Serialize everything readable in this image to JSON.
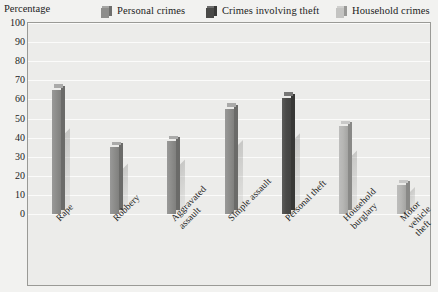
{
  "axis_title": "Percentage",
  "legend": {
    "items": [
      {
        "label": "Personal crimes",
        "icon": "cube-icon",
        "color": "#8e8e8c"
      },
      {
        "label": "Crimes involving theft",
        "icon": "cube-icon",
        "color": "#4a4a48"
      },
      {
        "label": "Household crimes",
        "icon": "cube-icon",
        "color": "#c4c4c2"
      }
    ]
  },
  "chart_data": {
    "type": "bar",
    "title": "",
    "xlabel": "",
    "ylabel": "Percentage",
    "ylim": [
      0,
      100
    ],
    "yticks": [
      100,
      90,
      80,
      70,
      60,
      50,
      40,
      30,
      20,
      10,
      0
    ],
    "grid": true,
    "legend_position": "top",
    "categories": [
      "Rape",
      "Robbery",
      "Aggravated\nassault",
      "Simple assault",
      "Personal theft",
      "Household\nburglary",
      "Motor vehicle\ntheft"
    ],
    "series": [
      {
        "name": "Personal crimes",
        "color": "#8e8e8c",
        "values": [
          65,
          35,
          38,
          55,
          null,
          null,
          null
        ]
      },
      {
        "name": "Crimes involving theft",
        "color": "#4a4a48",
        "values": [
          null,
          null,
          null,
          null,
          61,
          null,
          null
        ]
      },
      {
        "name": "Household crimes",
        "color": "#b6b6b4",
        "values": [
          null,
          null,
          null,
          null,
          null,
          46,
          15
        ]
      }
    ],
    "values": [
      65,
      35,
      38,
      55,
      61,
      46,
      15
    ],
    "bar_series_index": [
      0,
      0,
      0,
      0,
      1,
      2,
      2
    ]
  },
  "colors": {
    "page_background": "#f2f2f0",
    "plot_background": "#ececea",
    "plot_border": "#9a9a96",
    "gridline": "#fbfbfa",
    "text": "#1c1c1c"
  }
}
